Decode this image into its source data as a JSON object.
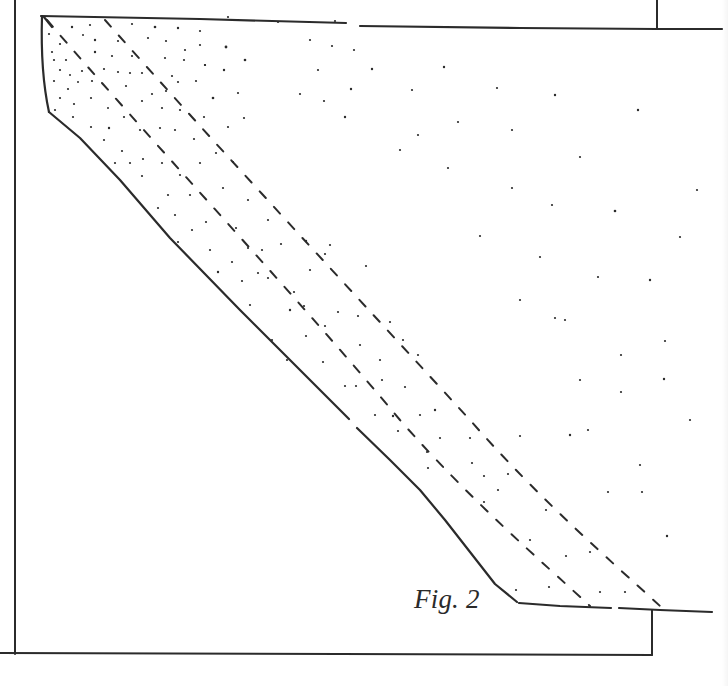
{
  "figure": {
    "caption": "Fig. 2",
    "ink_color": "#2b2b2b",
    "background_color": "#ffffff"
  }
}
